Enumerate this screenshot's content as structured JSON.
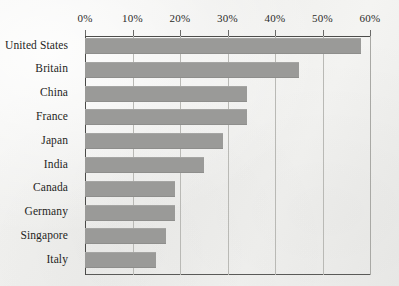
{
  "chart_data": {
    "type": "bar",
    "orientation": "horizontal",
    "title": "",
    "subtitle": "",
    "xlabel": "",
    "ylabel": "",
    "xlim": [
      0,
      60
    ],
    "xtick_labels": [
      "0%",
      "10%",
      "20%",
      "30%",
      "40%",
      "50%",
      "60%"
    ],
    "xtick_values": [
      0,
      10,
      20,
      30,
      40,
      50,
      60
    ],
    "grid": true,
    "grid_axis": "x",
    "legend": false,
    "legend_position": "none",
    "bar_color": "#9a9a98",
    "categories": [
      "United States",
      "Britain",
      "China",
      "France",
      "Japan",
      "India",
      "Canada",
      "Germany",
      "Singapore",
      "Italy"
    ],
    "values": [
      58,
      45,
      34,
      34,
      29,
      25,
      19,
      19,
      17,
      15
    ],
    "value_unit": "%"
  }
}
